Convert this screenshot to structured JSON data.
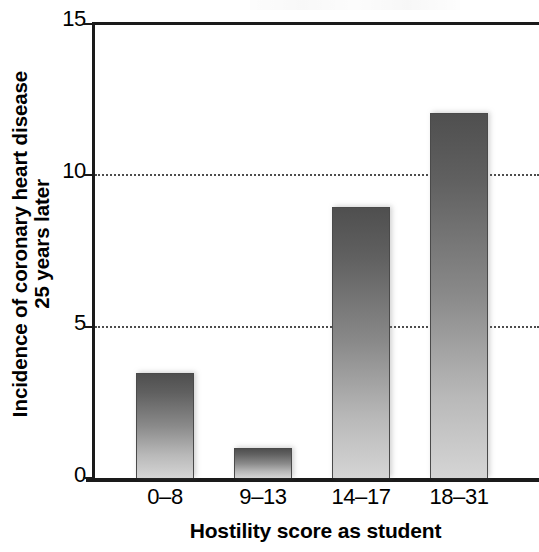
{
  "chart_data": {
    "type": "bar",
    "title": "",
    "subtitle": "",
    "xlabel": "Hostility score as student",
    "ylabel": "Incidence of coronary heart disease 25 years later",
    "ylabel_line1": "Incidence of coronary heart disease",
    "ylabel_line2": "25 years later",
    "categories": [
      "0–8",
      "9–13",
      "14–17",
      "18–31"
    ],
    "values": [
      3.45,
      1.0,
      8.9,
      12.0
    ],
    "ylim": [
      0,
      15
    ],
    "xlim_note": "four categorical bins; plot frame is cropped at the right edge of the image",
    "yticks": [
      0,
      5,
      10,
      15
    ],
    "ytick_labels": [
      "0",
      "5",
      "10",
      "15"
    ],
    "gridlines_at": [
      5,
      10
    ],
    "grid": "horizontal dotted at 5 and 10",
    "legend": "none",
    "legend_position": "none",
    "series": [
      {
        "name": "Incidence of coronary heart disease 25 years later",
        "values": [
          3.45,
          1.0,
          8.9,
          12.0
        ]
      }
    ],
    "annotations": [],
    "bar_style": "vertical gradient, dark grey at top fading to light grey at bottom",
    "colors": {
      "bar_top": "#4f4f4f",
      "bar_bottom": "#d5d5d5",
      "bar_outline": "#4a4a4a",
      "axis": "#1a1a1a",
      "gridline": "#4d4d4d",
      "text": "#000000",
      "background": "#ffffff"
    }
  },
  "axes": {
    "y_title_line1": "Incidence of coronary heart disease",
    "y_title_line2": "25 years later",
    "x_title": "Hostility score as student",
    "y_tick_0": "0",
    "y_tick_1": "5",
    "y_tick_2": "10",
    "y_tick_3": "15",
    "x_tick_0": "0–8",
    "x_tick_1": "9–13",
    "x_tick_2": "14–17",
    "x_tick_3": "18–31"
  }
}
